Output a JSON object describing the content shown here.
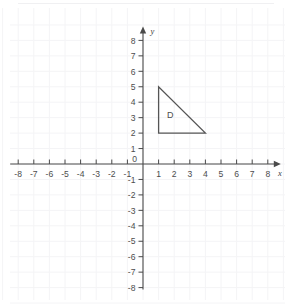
{
  "chart_data": {
    "type": "scatter",
    "title": "",
    "xlabel": "x",
    "ylabel": "y",
    "xlim": [
      -8,
      8
    ],
    "ylim": [
      -8,
      8
    ],
    "grid": true,
    "grid_style": "faint",
    "axes_style": "cartesian-arrows",
    "x_ticks": [
      -8,
      -7,
      -6,
      -5,
      -4,
      -3,
      -2,
      -1,
      1,
      2,
      3,
      4,
      5,
      6,
      7,
      8
    ],
    "x_tick_labels": [
      "-8",
      "-7",
      "-6",
      "-5",
      "-4",
      "-3",
      "-2",
      "-1",
      "1",
      "2",
      "3",
      "4",
      "5",
      "6",
      "7",
      "8"
    ],
    "y_ticks": [
      8,
      7,
      6,
      5,
      4,
      3,
      2,
      1,
      -1,
      -2,
      -3,
      -4,
      -5,
      -6,
      -7,
      -8
    ],
    "y_tick_labels": [
      "8",
      "7",
      "6",
      "5",
      "4",
      "3",
      "2",
      "1",
      "-1",
      "-2",
      "-3",
      "-4",
      "-5",
      "-6",
      "-7",
      "-8"
    ],
    "origin_label": "0",
    "shapes": [
      {
        "name": "D",
        "kind": "triangle",
        "label": "D",
        "label_position": [
          1.75,
          3.2
        ],
        "vertices": [
          [
            1,
            5
          ],
          [
            1,
            2
          ],
          [
            4,
            2
          ]
        ],
        "closed": true,
        "fill": "none",
        "stroke": "#555555"
      }
    ],
    "series": [],
    "legend": null,
    "annotations": []
  },
  "colors": {
    "background": "#ffffff",
    "axis": "#4a4a4a",
    "grid": "#f4f4f6",
    "shape_stroke": "#555555",
    "text": "#4d4d4d"
  }
}
